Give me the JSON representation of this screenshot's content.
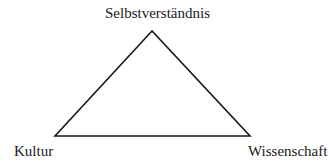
{
  "diagram": {
    "type": "triangle",
    "vertices": {
      "top": {
        "label": "Selbstverständnis",
        "x": 152,
        "y": 31
      },
      "bottom_left": {
        "label": "Kultur",
        "x": 55,
        "y": 136
      },
      "bottom_right": {
        "label": "Wissenschaft",
        "x": 250,
        "y": 136
      }
    },
    "stroke_color": "#1a1a1a",
    "background_color": "#ffffff"
  }
}
